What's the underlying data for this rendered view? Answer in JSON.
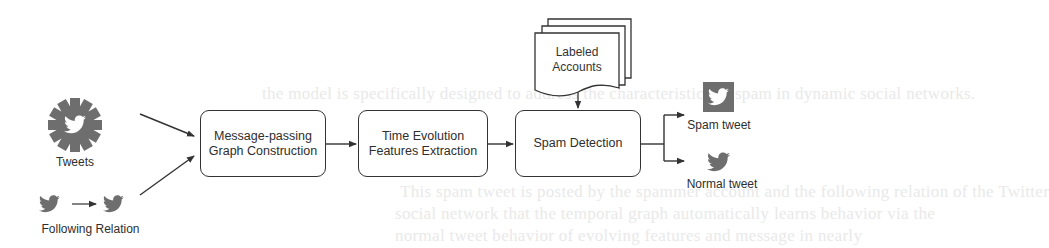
{
  "diagram": {
    "inputs": {
      "tweets": {
        "label": "Tweets",
        "icon": "twitter-gear-icon"
      },
      "following_relation": {
        "label": "Following Relation",
        "icon": "twitter-bird-arrow-icon"
      }
    },
    "steps": [
      {
        "id": "graph",
        "line1": "Message-passing",
        "line2": "Graph Construction"
      },
      {
        "id": "time",
        "line1": "Time Evolution",
        "line2": "Features Extraction"
      },
      {
        "id": "spam",
        "line1": "Spam Detection",
        "line2": ""
      }
    ],
    "labeled_accounts": {
      "line1": "Labeled",
      "line2": "Accounts",
      "icon": "document-stack-icon"
    },
    "outputs": [
      {
        "label": "Spam tweet",
        "icon": "twitter-square-icon"
      },
      {
        "label": "Normal tweet",
        "icon": "twitter-bird-icon"
      }
    ],
    "colors": {
      "stroke": "#333333",
      "icon_gray": "#6e6e6e",
      "text": "#2e2e2e"
    }
  },
  "background_text": [
    "the model is specifically designed to address the characteristics of spam in dynamic social networks.",
    "This spam tweet is posted by the spammer account and the following relation of the Twitter",
    "social network that the temporal graph automatically learns behavior via the",
    "normal tweet behavior of evolving features and message in nearly"
  ]
}
